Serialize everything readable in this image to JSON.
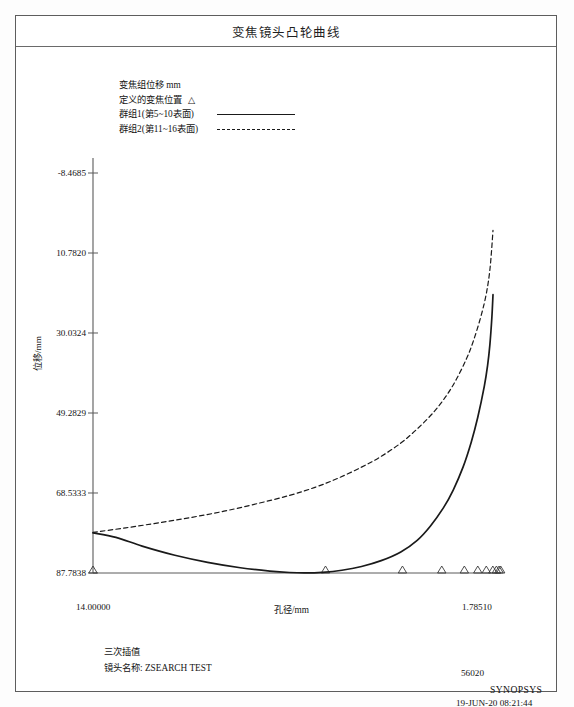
{
  "title": "变焦镜头凸轮曲线",
  "legend": {
    "units_line": "变焦组位移  mm",
    "defined_pos_label": "定义的变焦位置",
    "defined_pos_symbol": "△",
    "series1_label": "群组1(第5~10表面)",
    "series2_label": "群组2(第11~16表面)"
  },
  "axes": {
    "ylabel": "位移/mm",
    "xlabel": "孔径/mm",
    "xmin_label": "14.00000",
    "xmax_label": "1.78510",
    "yticks": [
      "87.7838",
      "68.5333",
      "49.2829",
      "30.0324",
      "10.7820",
      "-8.4685"
    ]
  },
  "footer": {
    "interp": "三次插值",
    "lens_name": "镜头名称: ZSEARCH  TEST",
    "code": "56020",
    "brand": "SYNOPSYS",
    "datetime": "19-JUN-20  08:21:44"
  },
  "colors": {
    "frame": "#5d5d5d",
    "curve": "#1a1a1a",
    "axis": "#5a5a5a",
    "background": "#ffffff"
  },
  "chart_data": {
    "type": "line",
    "title": "变焦镜头凸轮曲线",
    "xlabel": "孔径/mm",
    "ylabel": "位移/mm",
    "xlim": [
      14.0,
      1.7851
    ],
    "ylim": [
      -8.4685,
      87.7838
    ],
    "yticks": [
      -8.4685,
      10.782,
      30.0324,
      49.2829,
      68.5333,
      87.7838
    ],
    "grid": false,
    "legend_position": "top-left",
    "series": [
      {
        "name": "群组1(第5~10表面)",
        "style": "solid",
        "points": [
          [
            14.0,
            1.2
          ],
          [
            13.3,
            0.1
          ],
          [
            12.5,
            -2.0
          ],
          [
            11.5,
            -4.2
          ],
          [
            10.5,
            -5.9
          ],
          [
            9.5,
            -7.2
          ],
          [
            8.6,
            -8.0
          ],
          [
            8.0,
            -8.35
          ],
          [
            7.5,
            -8.45
          ],
          [
            7.0,
            -8.3
          ],
          [
            6.4,
            -7.8
          ],
          [
            5.8,
            -6.9
          ],
          [
            5.2,
            -5.5
          ],
          [
            4.6,
            -3.4
          ],
          [
            4.1,
            -0.6
          ],
          [
            3.7,
            2.8
          ],
          [
            3.3,
            7.2
          ],
          [
            3.0,
            11.5
          ],
          [
            2.7,
            17.0
          ],
          [
            2.45,
            23.0
          ],
          [
            2.25,
            29.0
          ],
          [
            2.05,
            36.5
          ],
          [
            1.95,
            41.5
          ],
          [
            1.88,
            46.5
          ],
          [
            1.82,
            53.0
          ],
          [
            1.7851,
            58.5
          ]
        ]
      },
      {
        "name": "群组2(第11~16表面)",
        "style": "dashed",
        "points": [
          [
            14.0,
            1.3
          ],
          [
            13.0,
            2.4
          ],
          [
            12.0,
            3.6
          ],
          [
            11.0,
            4.9
          ],
          [
            10.0,
            6.4
          ],
          [
            9.0,
            8.2
          ],
          [
            8.0,
            10.2
          ],
          [
            7.2,
            12.2
          ],
          [
            6.5,
            14.4
          ],
          [
            5.8,
            17.0
          ],
          [
            5.2,
            19.6
          ],
          [
            4.6,
            22.8
          ],
          [
            4.1,
            26.2
          ],
          [
            3.6,
            30.2
          ],
          [
            3.2,
            34.3
          ],
          [
            2.9,
            38.2
          ],
          [
            2.6,
            43.0
          ],
          [
            2.4,
            47.0
          ],
          [
            2.2,
            52.0
          ],
          [
            2.05,
            56.5
          ],
          [
            1.95,
            60.5
          ],
          [
            1.88,
            64.5
          ],
          [
            1.83,
            69.0
          ],
          [
            1.7851,
            74.0
          ]
        ]
      }
    ],
    "marker_series": {
      "name": "定义的变焦位置",
      "symbol": "triangle",
      "y": -8.4685,
      "x": [
        14.0,
        6.9,
        4.55,
        3.35,
        2.66,
        2.25,
        1.99,
        1.79,
        1.68,
        1.6,
        1.55
      ]
    }
  }
}
